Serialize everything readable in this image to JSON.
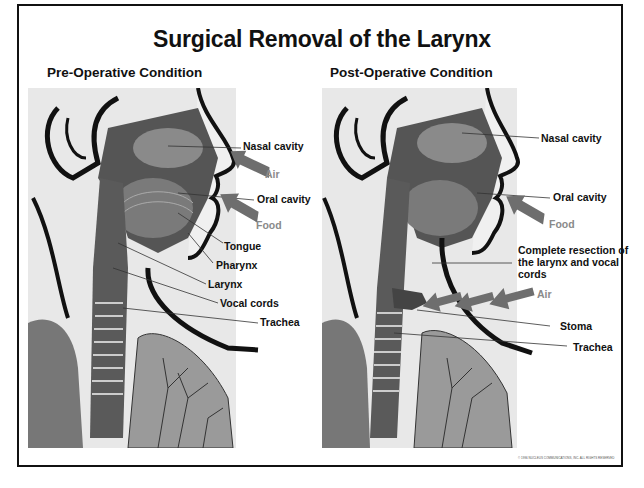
{
  "title": "Surgical Removal of the Larynx",
  "panels": [
    {
      "heading": "Pre-Operative Condition",
      "labels": {
        "nasal_cavity": "Nasal cavity",
        "air": "Air",
        "oral_cavity": "Oral cavity",
        "food": "Food",
        "tongue": "Tongue",
        "pharynx": "Pharynx",
        "larynx": "Larynx",
        "vocal_cords": "Vocal cords",
        "trachea": "Trachea"
      }
    },
    {
      "heading": "Post-Operative Condition",
      "labels": {
        "nasal_cavity": "Nasal cavity",
        "oral_cavity": "Oral cavity",
        "food": "Food",
        "resection": "Complete resection of the larynx and vocal cords",
        "air": "Air",
        "stoma": "Stoma",
        "trachea": "Trachea"
      }
    }
  ],
  "colors": {
    "label_text": "#111111",
    "flow_label_text": "#8a8a8a",
    "arrow_fill": "#6e6e6e",
    "border": "#111111"
  },
  "copyright": "© 1996 NUCLEUS COMMUNICATIONS, INC. ALL RIGHTS RESERVED"
}
